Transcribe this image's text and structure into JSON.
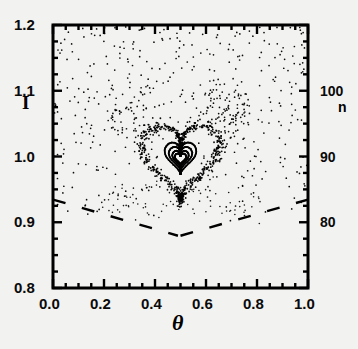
{
  "figure": {
    "type": "poincare-section",
    "background_color": "#f2f2f0",
    "ink_color": "#000000"
  },
  "axes": {
    "left": {
      "label": "I",
      "min": 0.8,
      "max": 1.2,
      "major_ticks": [
        "0.8",
        "0.9",
        "1.0",
        "1.1",
        "1.2"
      ],
      "major_values": [
        0.8,
        0.9,
        1.0,
        1.1,
        1.2
      ],
      "minor_step": 0.025
    },
    "bottom": {
      "label": "θ",
      "min": 0.0,
      "max": 1.0,
      "major_ticks": [
        "0.0",
        "0.2",
        "0.4",
        "0.6",
        "0.8",
        "1.0"
      ],
      "major_values": [
        0.0,
        0.2,
        0.4,
        0.6,
        0.8,
        1.0
      ],
      "minor_step": 0.05
    },
    "right": {
      "label": "n",
      "min": 70,
      "max": 110,
      "major_ticks": [
        "80",
        "90",
        "100"
      ],
      "major_values": [
        80,
        90,
        100
      ],
      "minor_step": 2.5
    }
  },
  "chart_data": {
    "type": "scatter",
    "title": "",
    "xlabel": "θ",
    "ylabel": "I",
    "y2label": "n",
    "xlim": [
      0.0,
      1.0
    ],
    "ylim": [
      0.8,
      1.2
    ],
    "y2lim": [
      70,
      110
    ],
    "grid": false,
    "legend": "none",
    "marker": "dot",
    "marker_size_px": 1.6,
    "series": [
      {
        "name": "inner-kam-curve-1",
        "kind": "heart-curve",
        "center": [
          0.5,
          0.9975
        ],
        "scale_x": 0.022,
        "scale_y": 0.0095,
        "n_points": 150,
        "description": "innermost nested heart-shaped invariant curve"
      },
      {
        "name": "inner-kam-curve-2",
        "kind": "heart-curve",
        "center": [
          0.5,
          0.9985
        ],
        "scale_x": 0.032,
        "scale_y": 0.0135,
        "n_points": 180,
        "description": "second nested heart-shaped invariant curve"
      },
      {
        "name": "inner-kam-curve-3",
        "kind": "heart-curve",
        "center": [
          0.5,
          1.0
        ],
        "scale_x": 0.046,
        "scale_y": 0.0195,
        "n_points": 220,
        "description": "third nested heart-shaped invariant curve"
      },
      {
        "name": "inner-kam-curve-4",
        "kind": "heart-curve",
        "center": [
          0.5,
          1.0015
        ],
        "scale_x": 0.062,
        "scale_y": 0.0265,
        "n_points": 260,
        "description": "outermost sharp heart-shaped invariant curve"
      },
      {
        "name": "outer-heart-band",
        "kind": "heart-band",
        "center": [
          0.5,
          1.0
        ],
        "scale_x": 0.155,
        "scale_y": 0.062,
        "band_width": 0.16,
        "n_points": 620,
        "description": "diffuse scattered band tracing a large heart-shaped separatrix"
      },
      {
        "name": "chaotic-sea",
        "kind": "scatter-cloud",
        "n_points": 430,
        "x_range": [
          0.0,
          1.0
        ],
        "y_range": [
          0.9,
          1.2
        ],
        "description": "sparse chaotic scatter filling the upper region of the section"
      },
      {
        "name": "island-fixed-points",
        "kind": "points",
        "points": [
          [
            0.355,
            1.013
          ],
          [
            0.645,
            1.013
          ],
          [
            0.425,
            0.967
          ],
          [
            0.575,
            0.967
          ]
        ],
        "description": "isolated period-orbit points near the inner heart"
      },
      {
        "name": "lower-separatrix-left",
        "kind": "dashed-line",
        "from": [
          0.0,
          0.9345
        ],
        "to": [
          0.49,
          0.8795
        ],
        "description": "dashed line descending left-to-right forming left arm of V"
      },
      {
        "name": "lower-separatrix-right",
        "kind": "dashed-line",
        "from": [
          0.5,
          0.8795
        ],
        "to": [
          1.0,
          0.9345
        ],
        "description": "dashed line ascending left-to-right forming right arm of V"
      }
    ]
  }
}
